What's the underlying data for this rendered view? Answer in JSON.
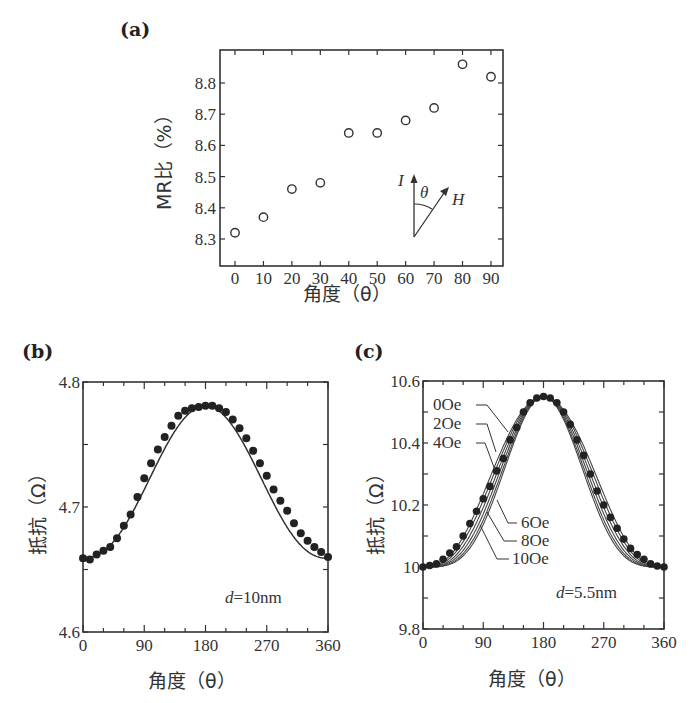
{
  "chart_data": [
    {
      "id": "a",
      "panel_label": "(a)",
      "type": "scatter",
      "marker": "open-circle",
      "title": "",
      "xlabel": "角度（θ）",
      "ylabel": "MR比（%）",
      "xlim": [
        -5,
        95
      ],
      "ylim": [
        8.22,
        8.9
      ],
      "xticks": [
        0,
        10,
        20,
        30,
        40,
        50,
        60,
        70,
        80,
        90
      ],
      "xtick_labels": [
        "0",
        "10",
        "20",
        "30",
        "40",
        "50",
        "60",
        "70",
        "80",
        "90"
      ],
      "yticks": [
        8.3,
        8.4,
        8.5,
        8.6,
        8.7,
        8.8
      ],
      "ytick_labels": [
        "8.3",
        "8.4",
        "8.5",
        "8.6",
        "8.7",
        "8.8"
      ],
      "grid": false,
      "x": [
        0,
        10,
        20,
        30,
        40,
        50,
        60,
        70,
        80,
        90
      ],
      "y": [
        8.32,
        8.37,
        8.46,
        8.48,
        8.64,
        8.64,
        8.68,
        8.72,
        8.86,
        8.82
      ],
      "inset": {
        "current_label": "I",
        "angle_label": "θ",
        "field_label": "H"
      }
    },
    {
      "id": "b",
      "panel_label": "(b)",
      "type": "scatter+line",
      "marker": "filled-circle",
      "xlabel": "角度（θ）",
      "ylabel": "抵抗（Ω）",
      "xlim": [
        0,
        360
      ],
      "ylim": [
        4.6,
        4.8
      ],
      "xticks": [
        0,
        90,
        180,
        270,
        360
      ],
      "xtick_labels": [
        "0",
        "90",
        "180",
        "270",
        "360"
      ],
      "yticks": [
        4.6,
        4.7,
        4.8
      ],
      "ytick_labels": [
        "4.6",
        "4.7",
        "4.8"
      ],
      "grid": false,
      "annotation": "d=10nm",
      "series": [
        {
          "name": "measured",
          "x": [
            0,
            10,
            20,
            30,
            40,
            50,
            60,
            70,
            80,
            90,
            100,
            110,
            120,
            130,
            140,
            150,
            160,
            170,
            180,
            190,
            200,
            210,
            220,
            230,
            240,
            250,
            260,
            270,
            280,
            290,
            300,
            310,
            320,
            330,
            340,
            350,
            360
          ],
          "y": [
            4.659,
            4.658,
            4.662,
            4.665,
            4.668,
            4.675,
            4.685,
            4.694,
            4.708,
            4.723,
            4.735,
            4.746,
            4.756,
            4.765,
            4.773,
            4.777,
            4.779,
            4.78,
            4.781,
            4.781,
            4.779,
            4.776,
            4.77,
            4.763,
            4.755,
            4.745,
            4.735,
            4.725,
            4.714,
            4.705,
            4.697,
            4.687,
            4.679,
            4.673,
            4.668,
            4.664,
            4.66
          ]
        },
        {
          "name": "fit",
          "style": "line",
          "min": 4.659,
          "max": 4.781
        }
      ]
    },
    {
      "id": "c",
      "panel_label": "(c)",
      "type": "scatter+line",
      "marker": "filled-circle",
      "xlabel": "角度（θ）",
      "ylabel": "抵抗（Ω）",
      "xlim": [
        0,
        360
      ],
      "ylim": [
        9.8,
        10.6
      ],
      "xticks": [
        0,
        90,
        180,
        270,
        360
      ],
      "xtick_labels": [
        "0",
        "90",
        "180",
        "270",
        "360"
      ],
      "yticks": [
        9.8,
        10,
        10.2,
        10.4,
        10.6
      ],
      "ytick_labels": [
        "9.8",
        "10",
        "10.2",
        "10.4",
        "10.6"
      ],
      "grid": false,
      "annotation": "d=5.5nm",
      "series": [
        {
          "name": "0 Oe",
          "label": "0Oe",
          "shift": -14
        },
        {
          "name": "2 Oe",
          "label": "2Oe",
          "shift": -9
        },
        {
          "name": "4 Oe",
          "label": "4Oe",
          "shift": -3
        },
        {
          "name": "6 Oe",
          "label": "6Oe",
          "shift": 3
        },
        {
          "name": "8 Oe",
          "label": "8Oe",
          "shift": 9
        },
        {
          "name": "10 Oe",
          "label": "10Oe",
          "shift": 14
        },
        {
          "name": "measured",
          "x": [
            0,
            10,
            20,
            30,
            40,
            50,
            60,
            70,
            80,
            90,
            100,
            110,
            120,
            130,
            140,
            150,
            160,
            170,
            180,
            190,
            200,
            210,
            220,
            230,
            240,
            250,
            260,
            270,
            280,
            290,
            300,
            310,
            320,
            330,
            340,
            350,
            360
          ],
          "y": [
            10.0,
            10.005,
            10.01,
            10.025,
            10.045,
            10.065,
            10.1,
            10.14,
            10.18,
            10.22,
            10.26,
            10.31,
            10.35,
            10.41,
            10.45,
            10.5,
            10.53,
            10.545,
            10.55,
            10.545,
            10.53,
            10.5,
            10.46,
            10.41,
            10.36,
            10.3,
            10.245,
            10.2,
            10.16,
            10.125,
            10.09,
            10.06,
            10.04,
            10.025,
            10.01,
            10.003,
            10.0
          ]
        }
      ],
      "min": 10.0,
      "max": 10.55
    }
  ]
}
